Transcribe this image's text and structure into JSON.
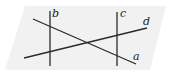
{
  "diagram": {
    "type": "plane-with-lines",
    "plane": {
      "shape": "parallelogram",
      "points": [
        [
          25,
          6
        ],
        [
          166,
          6
        ],
        [
          150,
          70
        ],
        [
          5,
          70
        ]
      ],
      "fill": "#f1f1f1"
    },
    "lines": [
      {
        "name": "b",
        "x1": 50,
        "y1": 11,
        "x2": 50,
        "y2": 66
      },
      {
        "name": "c",
        "x1": 117,
        "y1": 12,
        "x2": 117,
        "y2": 66
      },
      {
        "name": "a",
        "x1": 33,
        "y1": 19,
        "x2": 136,
        "y2": 64
      },
      {
        "name": "d",
        "x1": 24,
        "y1": 58,
        "x2": 147,
        "y2": 28
      }
    ],
    "labels": {
      "b": "b",
      "c": "c",
      "d": "d",
      "a": "a"
    },
    "line_color": "#2a2a2a"
  }
}
